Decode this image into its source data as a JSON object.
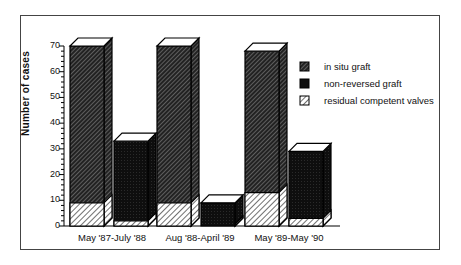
{
  "chart_data": {
    "type": "bar",
    "subtype": "stacked 3D bar (paired groups)",
    "title": "",
    "xlabel": "",
    "ylabel": "Number of cases",
    "ylim": [
      0,
      70
    ],
    "yticks": [
      0,
      10,
      20,
      30,
      40,
      50,
      60,
      70
    ],
    "grid": false,
    "legend_position": "upper right",
    "categories": [
      "May '87-July '88",
      "Aug '88-April '89",
      "May '89-May '90"
    ],
    "series": [
      {
        "name": "in situ graft",
        "pattern": "dense dark hatch",
        "values": [
          70,
          70,
          68
        ],
        "note": "total bar height for in situ group; includes residual competent valves"
      },
      {
        "name": "non-reversed graft",
        "pattern": "solid black",
        "values": [
          33,
          9,
          29
        ],
        "note": "total bar height for non-reversed group; includes residual competent valves"
      },
      {
        "name": "residual competent valves",
        "pattern": "light hatch",
        "values_in_situ": [
          9,
          9,
          13
        ],
        "values_non_reversed": [
          2,
          0,
          3
        ]
      }
    ]
  },
  "axis": {
    "ylabel": "Number of cases",
    "ticks": [
      "0",
      "10",
      "20",
      "30",
      "40",
      "50",
      "60",
      "70"
    ]
  },
  "categories": [
    "May '87-July '88",
    "Aug '88-April '89",
    "May '89-May '90"
  ],
  "legend": {
    "items": [
      "in situ graft",
      "non-reversed graft",
      "residual competent valves"
    ]
  },
  "colors": {
    "frame": "#444444",
    "bar_dark": "#111111",
    "hatch_light": "#ffffff"
  }
}
